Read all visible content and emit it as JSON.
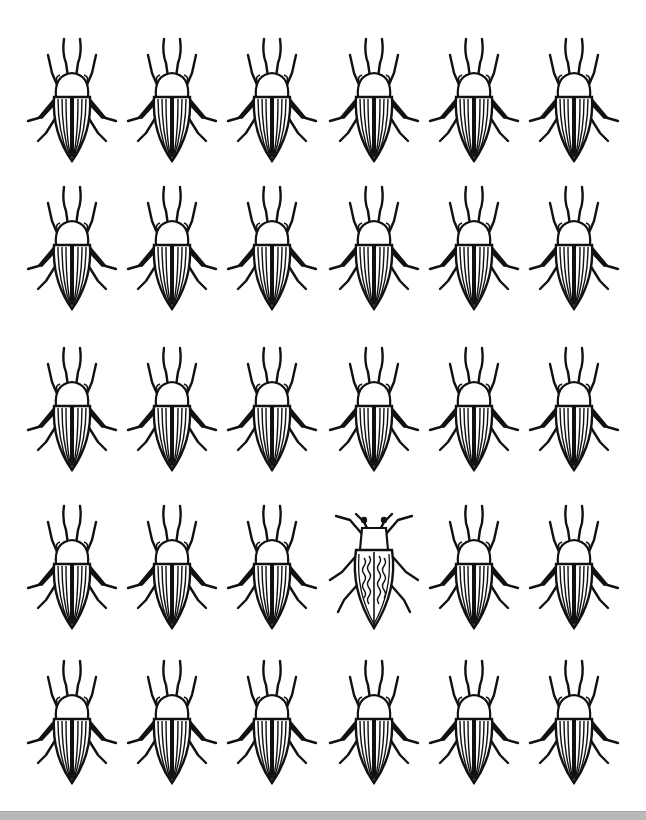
{
  "puzzle": {
    "type": "find-the-odd-one-out",
    "rows": 5,
    "columns": 6,
    "item": "striped beetle",
    "odd_item": {
      "row": 4,
      "column": 4,
      "description": "beetle with wavy stripes and square head"
    },
    "column_centers_x": [
      72,
      172,
      272,
      374,
      474,
      574
    ],
    "row_tops_y": [
      33,
      181,
      342,
      500,
      655
    ],
    "colors": {
      "ink": "#111111",
      "paper": "#ffffff",
      "band": "#b9b9b9"
    }
  },
  "top_caption": "",
  "bottom_band": {
    "visible": true
  }
}
